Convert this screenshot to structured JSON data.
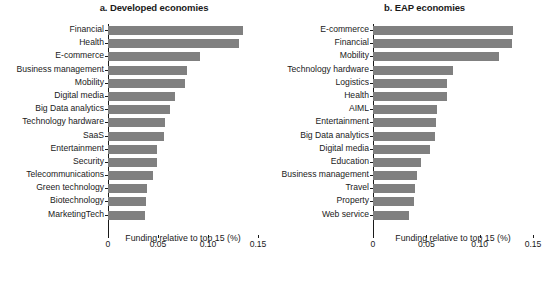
{
  "chart_data": [
    {
      "type": "bar",
      "orientation": "horizontal",
      "panel_label": "a.",
      "title": "a. Developed economies",
      "xlabel": "Funding relative to top 15 (%)",
      "ylabel": "",
      "xlim": [
        0,
        0.15
      ],
      "xticks": [
        0,
        0.05,
        0.1,
        0.15
      ],
      "xtick_labels": [
        "0",
        "0.05",
        "0.10",
        "0.15"
      ],
      "grid": false,
      "legend": false,
      "bar_color": "#808080",
      "categories": [
        "Financial",
        "Health",
        "E-commerce",
        "Business management",
        "Mobility",
        "Digital media",
        "Big Data analytics",
        "Technology hardware",
        "SaaS",
        "Entertainment",
        "Security",
        "Telecommunications",
        "Green technology",
        "Biotechnology",
        "MarketingTech"
      ],
      "values": [
        0.135,
        0.131,
        0.092,
        0.079,
        0.077,
        0.067,
        0.062,
        0.057,
        0.056,
        0.049,
        0.049,
        0.045,
        0.039,
        0.038,
        0.037
      ]
    },
    {
      "type": "bar",
      "orientation": "horizontal",
      "panel_label": "b.",
      "title": "b. EAP economies",
      "xlabel": "Funding relative to top 15 (%)",
      "ylabel": "",
      "xlim": [
        0,
        0.15
      ],
      "xticks": [
        0,
        0.05,
        0.1,
        0.15
      ],
      "xtick_labels": [
        "0",
        "0.05",
        "0.10",
        "0.15"
      ],
      "grid": false,
      "legend": false,
      "bar_color": "#808080",
      "categories": [
        "E-commerce",
        "Financial",
        "Mobility",
        "Technology hardware",
        "Logistics",
        "Health",
        "AIML",
        "Entertainment",
        "Big Data analytics",
        "Digital media",
        "Education",
        "Business management",
        "Travel",
        "Property",
        "Web service"
      ],
      "values": [
        0.131,
        0.13,
        0.118,
        0.075,
        0.069,
        0.069,
        0.06,
        0.059,
        0.058,
        0.053,
        0.045,
        0.041,
        0.039,
        0.038,
        0.034,
        0.034
      ]
    }
  ],
  "colors": {
    "bar": "#808080",
    "axis": "#1a1a1a",
    "background": "#ffffff"
  }
}
